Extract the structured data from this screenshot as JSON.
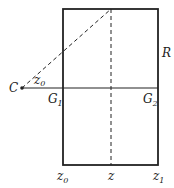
{
  "diagram": {
    "labels": {
      "C": "C",
      "R": "R",
      "G1": {
        "base": "G",
        "sub": "1"
      },
      "G2": {
        "base": "G",
        "sub": "2"
      },
      "z0_angle": {
        "base": "z",
        "sub": "0"
      },
      "z0_bottom": {
        "base": "z",
        "sub": "0"
      },
      "z_bottom": "z",
      "z1_bottom": {
        "base": "z",
        "sub": "1"
      }
    },
    "colors": {
      "stroke": "#222222",
      "background": "#ffffff"
    }
  }
}
